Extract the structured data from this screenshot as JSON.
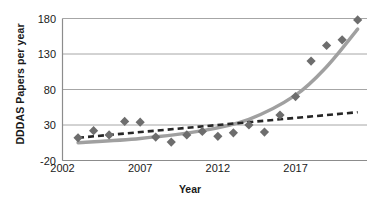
{
  "chart_data": {
    "type": "scatter",
    "title": "",
    "xlabel": "Year",
    "ylabel": "DDDAS Papers per year",
    "xlim": [
      2002,
      2021.6
    ],
    "ylim": [
      -20,
      180
    ],
    "yticks": [
      180,
      130,
      80,
      30,
      -20
    ],
    "xticks": [
      2002,
      2007,
      2012,
      2017
    ],
    "grid": true,
    "legend": "none",
    "marker": "diamond",
    "series": [
      {
        "name": "DDDAS papers per year",
        "type": "scatter",
        "x": [
          2003,
          2004,
          2005,
          2006,
          2007,
          2008,
          2009,
          2010,
          2011,
          2012,
          2013,
          2014,
          2015,
          2016,
          2017,
          2018,
          2019,
          2020,
          2021
        ],
        "values": [
          12,
          22,
          16,
          35,
          34,
          13,
          6,
          16,
          21,
          14,
          19,
          30,
          20,
          44,
          70,
          120,
          142,
          150,
          178
        ]
      },
      {
        "name": "Linear trendline",
        "type": "line",
        "style": "dashed",
        "x": [
          2003,
          2021
        ],
        "values": [
          12,
          48
        ]
      },
      {
        "name": "Exponential trendline",
        "type": "line",
        "style": "solid",
        "x": [
          2003,
          2007,
          2011,
          2014,
          2017,
          2019,
          2021
        ],
        "values": [
          5,
          11,
          22,
          38,
          72,
          112,
          165
        ]
      }
    ]
  },
  "colors": {
    "marker": "#6d6d6d",
    "dashed_line": "#262626",
    "solid_line": "#a0a0a0",
    "gridline": "#a6a6a6",
    "axis": "#8c8c8c",
    "text": "#1a1a1a",
    "background": "#ffffff"
  },
  "axes": {
    "y_title": "DDDAS Papers per year",
    "x_title": "Year",
    "y_tick_labels": [
      "180",
      "130",
      "80",
      "30",
      "-20"
    ],
    "x_tick_labels": [
      "2002",
      "2007",
      "2012",
      "2017"
    ]
  }
}
